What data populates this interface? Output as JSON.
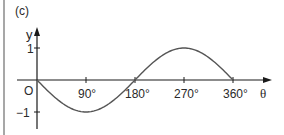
{
  "figure": {
    "panel_label": "(c)",
    "origin_label": "O",
    "y_axis_label": "y",
    "x_axis_label": "θ",
    "y_ticks": [
      "1",
      "−1"
    ],
    "x_ticks": [
      "90°",
      "180°",
      "270°",
      "360°"
    ]
  },
  "colors": {
    "axis": "#1a1a1a",
    "curve": "#555555",
    "text": "#2a2a2a",
    "border": "#888888"
  },
  "chart_data": {
    "type": "line",
    "title": "(c)",
    "function": "y = -sin(θ)",
    "xlabel": "θ",
    "ylabel": "y",
    "xlim": [
      0,
      360
    ],
    "ylim": [
      -1,
      1
    ],
    "grid": false,
    "legend": null,
    "x_tick_labels": [
      "90°",
      "180°",
      "270°",
      "360°"
    ],
    "y_tick_labels": [
      "1",
      "−1"
    ],
    "series": [
      {
        "name": "y = -sin θ",
        "x": [
          0,
          45,
          90,
          135,
          180,
          225,
          270,
          315,
          360
        ],
        "y": [
          0,
          -0.71,
          -1,
          -0.71,
          0,
          0.71,
          1,
          0.71,
          0
        ]
      }
    ],
    "annotations": [
      "O"
    ]
  }
}
